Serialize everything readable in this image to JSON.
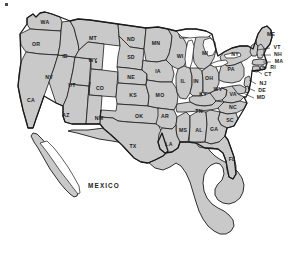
{
  "map": {
    "title": "Map of the contiguous United States with Mexico",
    "type": "political-choropleth-outline",
    "projection_note": "conic, lower 48 states plus northern Mexico",
    "colors": {
      "land_fill": "#c9c9c9",
      "border_stroke": "#1a1a1a",
      "water_fill": "#ffffff",
      "background": "#ffffff",
      "label_color": "#1c1c1c"
    },
    "country_labels": [
      {
        "name": "MEXICO",
        "x": 104,
        "y": 186
      }
    ],
    "states": [
      {
        "abbr": "WA",
        "name": "Washington",
        "lx": 45,
        "ly": 23,
        "leader": false
      },
      {
        "abbr": "OR",
        "name": "Oregon",
        "lx": 36,
        "ly": 45,
        "leader": false
      },
      {
        "abbr": "ID",
        "name": "Idaho",
        "lx": 65,
        "ly": 57,
        "leader": false
      },
      {
        "abbr": "MT",
        "name": "Montana",
        "lx": 93,
        "ly": 39,
        "leader": false
      },
      {
        "abbr": "ND",
        "name": "North Dakota",
        "lx": 131,
        "ly": 40,
        "leader": false
      },
      {
        "abbr": "SD",
        "name": "South Dakota",
        "lx": 131,
        "ly": 58,
        "leader": false
      },
      {
        "abbr": "MN",
        "name": "Minnesota",
        "lx": 156,
        "ly": 44,
        "leader": false
      },
      {
        "abbr": "WI",
        "name": "Wisconsin",
        "lx": 180,
        "ly": 57,
        "leader": false
      },
      {
        "abbr": "MI",
        "name": "Michigan",
        "lx": 205,
        "ly": 54,
        "leader": false
      },
      {
        "abbr": "WY",
        "name": "Wyoming",
        "lx": 93,
        "ly": 61,
        "leader": false
      },
      {
        "abbr": "NV",
        "name": "Nevada",
        "lx": 49,
        "ly": 78,
        "leader": false
      },
      {
        "abbr": "UT",
        "name": "Utah",
        "lx": 72,
        "ly": 86,
        "leader": false
      },
      {
        "abbr": "CO",
        "name": "Colorado",
        "lx": 100,
        "ly": 89,
        "leader": false
      },
      {
        "abbr": "NE",
        "name": "Nebraska",
        "lx": 131,
        "ly": 78,
        "leader": false
      },
      {
        "abbr": "IA",
        "name": "Iowa",
        "lx": 158,
        "ly": 72,
        "leader": false
      },
      {
        "abbr": "KS",
        "name": "Kansas",
        "lx": 133,
        "ly": 96,
        "leader": false
      },
      {
        "abbr": "MO",
        "name": "Missouri",
        "lx": 160,
        "ly": 96,
        "leader": false
      },
      {
        "abbr": "IL",
        "name": "Illinois",
        "lx": 183,
        "ly": 82,
        "leader": false
      },
      {
        "abbr": "IN",
        "name": "Indiana",
        "lx": 196,
        "ly": 82,
        "leader": false
      },
      {
        "abbr": "OH",
        "name": "Ohio",
        "lx": 209,
        "ly": 79,
        "leader": false
      },
      {
        "abbr": "PA",
        "name": "Pennsylvania",
        "lx": 231,
        "ly": 70,
        "leader": false
      },
      {
        "abbr": "NY",
        "name": "New York",
        "lx": 235,
        "ly": 55,
        "leader": false
      },
      {
        "abbr": "WV",
        "name": "West Virginia",
        "lx": 218,
        "ly": 90,
        "leader": false
      },
      {
        "abbr": "VA",
        "name": "Virginia",
        "lx": 233,
        "ly": 95,
        "leader": false
      },
      {
        "abbr": "KY",
        "name": "Kentucky",
        "lx": 203,
        "ly": 95,
        "leader": false
      },
      {
        "abbr": "CA",
        "name": "California",
        "lx": 31,
        "ly": 101,
        "leader": false
      },
      {
        "abbr": "AZ",
        "name": "Arizona",
        "lx": 66,
        "ly": 116,
        "leader": false
      },
      {
        "abbr": "NM",
        "name": "New Mexico",
        "lx": 99,
        "ly": 119,
        "leader": false
      },
      {
        "abbr": "OK",
        "name": "Oklahoma",
        "lx": 139,
        "ly": 117,
        "leader": false
      },
      {
        "abbr": "AR",
        "name": "Arkansas",
        "lx": 165,
        "ly": 117,
        "leader": false
      },
      {
        "abbr": "TN",
        "name": "Tennessee",
        "lx": 199,
        "ly": 112,
        "leader": false
      },
      {
        "abbr": "NC",
        "name": "North Carolina",
        "lx": 233,
        "ly": 108,
        "leader": false
      },
      {
        "abbr": "SC",
        "name": "South Carolina",
        "lx": 230,
        "ly": 121,
        "leader": false
      },
      {
        "abbr": "MS",
        "name": "Mississippi",
        "lx": 183,
        "ly": 131,
        "leader": false
      },
      {
        "abbr": "AL",
        "name": "Alabama",
        "lx": 199,
        "ly": 131,
        "leader": false
      },
      {
        "abbr": "GA",
        "name": "Georgia",
        "lx": 214,
        "ly": 130,
        "leader": false
      },
      {
        "abbr": "LA",
        "name": "Louisiana",
        "lx": 169,
        "ly": 145,
        "leader": false
      },
      {
        "abbr": "TX",
        "name": "Texas",
        "lx": 133,
        "ly": 147,
        "leader": false
      },
      {
        "abbr": "FL",
        "name": "Florida",
        "lx": 232,
        "ly": 160,
        "leader": false
      },
      {
        "abbr": "ME",
        "name": "Maine",
        "lx": 271,
        "ly": 35,
        "leader": false
      },
      {
        "abbr": "VT",
        "name": "Vermont",
        "lx": 277,
        "ly": 48,
        "leader": true,
        "leader_path": "M 270 48 L 257 50"
      },
      {
        "abbr": "NH",
        "name": "New Hampshire",
        "lx": 278,
        "ly": 55,
        "leader": true,
        "leader_path": "M 271 55 L 261 55"
      },
      {
        "abbr": "MA",
        "name": "Massachusetts",
        "lx": 279,
        "ly": 62,
        "leader": true,
        "leader_path": "M 271 62 L 263 62"
      },
      {
        "abbr": "RI",
        "name": "Rhode Island",
        "lx": 273,
        "ly": 68,
        "leader": true,
        "leader_path": "M 267 68 L 262 67"
      },
      {
        "abbr": "CT",
        "name": "Connecticut",
        "lx": 268,
        "ly": 75,
        "leader": true,
        "leader_path": "M 262 74 L 256 70"
      },
      {
        "abbr": "NJ",
        "name": "New Jersey",
        "lx": 263,
        "ly": 84,
        "leader": true,
        "leader_path": "M 256 84 L 249 80"
      },
      {
        "abbr": "DE",
        "name": "Delaware",
        "lx": 262,
        "ly": 91,
        "leader": true,
        "leader_path": "M 255 91 L 248 88"
      },
      {
        "abbr": "MD",
        "name": "Maryland",
        "lx": 261,
        "ly": 98,
        "leader": true,
        "leader_path": "M 254 98 L 245 94"
      }
    ],
    "water_bodies": [
      {
        "name": "Great Lakes",
        "fill": "#ffffff"
      }
    ],
    "specks": [
      {
        "x": 5,
        "y": 3,
        "w": 3,
        "h": 3
      },
      {
        "x": 95,
        "y": 61,
        "w": 2,
        "h": 2
      }
    ]
  }
}
